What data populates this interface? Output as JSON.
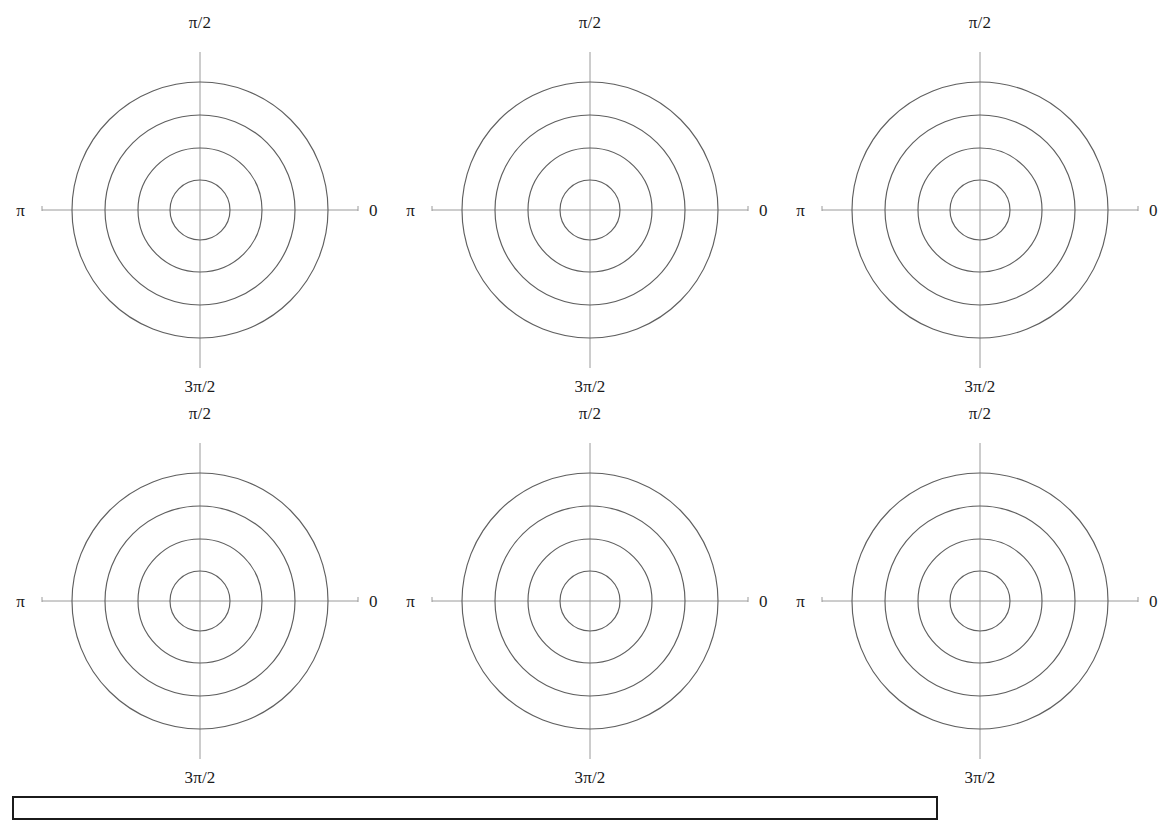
{
  "figure": {
    "background_color": "#ffffff",
    "axis_color": "#9a9a9a",
    "circle_color": "#5f5f5f",
    "text_color": "#1a1a1a",
    "box_border_color": "#1b1b1b",
    "width": 1170,
    "height": 820,
    "panel_count": 6,
    "rows": 2,
    "columns": 3
  },
  "labels": {
    "top": "π/2",
    "left": "π",
    "right": "0",
    "bottom": "3π/2"
  },
  "caption_box": {
    "x": 12,
    "y": 796,
    "width": 926,
    "height": 24,
    "text": ""
  },
  "panels": [
    {
      "id": "panel-r1c1",
      "row": 1,
      "col": 1,
      "origin_x": 0,
      "origin_y": 0,
      "center_x": 200,
      "center_y": 210,
      "labels": {
        "top": "π/2",
        "left": "π",
        "right": "0",
        "bottom": "3π/2"
      }
    },
    {
      "id": "panel-r1c2",
      "row": 1,
      "col": 2,
      "origin_x": 390,
      "origin_y": 0,
      "center_x": 200,
      "center_y": 210,
      "labels": {
        "top": "π/2",
        "left": "π",
        "right": "0",
        "bottom": "3π/2"
      }
    },
    {
      "id": "panel-r1c3",
      "row": 1,
      "col": 3,
      "origin_x": 780,
      "origin_y": 0,
      "center_x": 200,
      "center_y": 210,
      "labels": {
        "top": "π/2",
        "left": "π",
        "right": "0",
        "bottom": "3π/2"
      }
    },
    {
      "id": "panel-r2c1",
      "row": 2,
      "col": 1,
      "origin_x": 0,
      "origin_y": 391,
      "center_x": 200,
      "center_y": 210,
      "labels": {
        "top": "π/2",
        "left": "π",
        "right": "0",
        "bottom": "3π/2"
      }
    },
    {
      "id": "panel-r2c2",
      "row": 2,
      "col": 2,
      "origin_x": 390,
      "origin_y": 391,
      "center_x": 200,
      "center_y": 210,
      "labels": {
        "top": "π/2",
        "left": "π",
        "right": "0",
        "bottom": "3π/2"
      }
    },
    {
      "id": "panel-r2c3",
      "row": 2,
      "col": 3,
      "origin_x": 780,
      "origin_y": 391,
      "center_x": 200,
      "center_y": 210,
      "labels": {
        "top": "π/2",
        "left": "π",
        "right": "0",
        "bottom": "3π/2"
      }
    }
  ],
  "chart_data": {
    "type": "line",
    "title": "",
    "subtitle": "",
    "xlabel": "",
    "ylabel": "",
    "projection": "polar",
    "grid": true,
    "legend": null,
    "panel_layout": {
      "rows": 2,
      "cols": 3,
      "total": 6
    },
    "angular_ticks": [
      {
        "angle_deg": 0,
        "label": "0"
      },
      {
        "angle_deg": 90,
        "label": "π/2"
      },
      {
        "angle_deg": 180,
        "label": "π"
      },
      {
        "angle_deg": 270,
        "label": "3π/2"
      }
    ],
    "radial_rings": [
      {
        "index": 1,
        "radius_px": 30
      },
      {
        "index": 2,
        "radius_px": 62
      },
      {
        "index": 3,
        "radius_px": 95
      },
      {
        "index": 4,
        "radius_px": 128
      }
    ],
    "axis_half_length_px": 158,
    "series": [
      {
        "name": "contour-1",
        "panel": "panel-r1c1",
        "radii_px": [
          30,
          62,
          95,
          128
        ]
      },
      {
        "name": "contour-2",
        "panel": "panel-r1c2",
        "radii_px": [
          30,
          62,
          95,
          128
        ]
      },
      {
        "name": "contour-3",
        "panel": "panel-r1c3",
        "radii_px": [
          30,
          62,
          95,
          128
        ]
      },
      {
        "name": "contour-4",
        "panel": "panel-r2c1",
        "radii_px": [
          30,
          62,
          95,
          128
        ]
      },
      {
        "name": "contour-5",
        "panel": "panel-r2c2",
        "radii_px": [
          30,
          62,
          95,
          128
        ]
      },
      {
        "name": "contour-6",
        "panel": "panel-r2c3",
        "radii_px": [
          30,
          62,
          95,
          128
        ]
      }
    ]
  }
}
